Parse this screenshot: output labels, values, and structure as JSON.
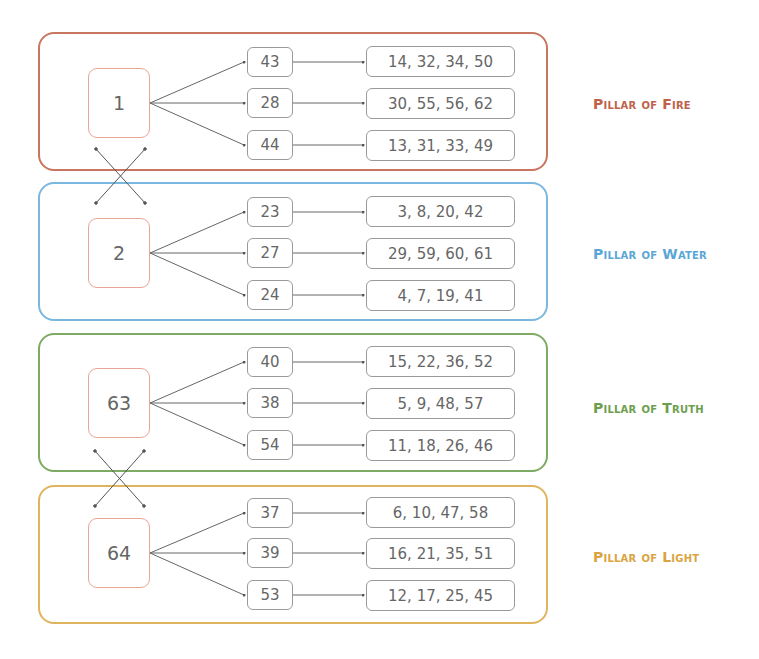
{
  "diagram": {
    "pillars": [
      {
        "name": "Pillar of Fire",
        "color": "#c0614a",
        "hub": "1",
        "branches": [
          {
            "node": "43",
            "values": "14, 32, 34, 50"
          },
          {
            "node": "28",
            "values": "30, 55, 56, 62"
          },
          {
            "node": "44",
            "values": "13, 31, 33, 49"
          }
        ]
      },
      {
        "name": "Pillar of Water",
        "color": "#5aa6d6",
        "hub": "2",
        "branches": [
          {
            "node": "23",
            "values": "3, 8, 20, 42"
          },
          {
            "node": "27",
            "values": "29, 59, 60, 61"
          },
          {
            "node": "24",
            "values": "4, 7, 19, 41"
          }
        ]
      },
      {
        "name": "Pillar of Truth",
        "color": "#6c9e4e",
        "hub": "63",
        "branches": [
          {
            "node": "40",
            "values": "15, 22, 36, 52"
          },
          {
            "node": "38",
            "values": "5, 9, 48, 57"
          },
          {
            "node": "54",
            "values": "11, 18, 26, 46"
          }
        ]
      },
      {
        "name": "Pillar of Light",
        "color": "#d9a440",
        "hub": "64",
        "branches": [
          {
            "node": "37",
            "values": "6, 10, 47, 58"
          },
          {
            "node": "39",
            "values": "16, 21, 35, 51"
          },
          {
            "node": "53",
            "values": "12, 17, 25, 45"
          }
        ]
      }
    ],
    "swaps": [
      {
        "between": [
          "1",
          "2"
        ]
      },
      {
        "between": [
          "63",
          "64"
        ]
      }
    ]
  }
}
